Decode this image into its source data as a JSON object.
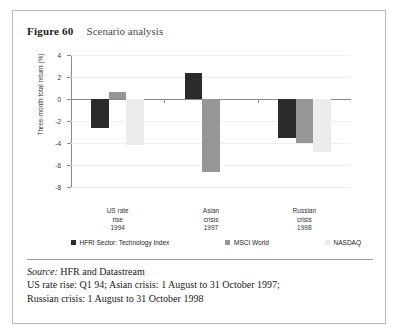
{
  "figure": {
    "number": "Figure 60",
    "title": "Scenario analysis"
  },
  "chart_data": {
    "type": "bar",
    "title": "Scenario analysis",
    "xlabel": "",
    "ylabel": "Three-month total return (%)",
    "ylim": [
      -8,
      4
    ],
    "yticks": [
      "4",
      "2",
      "0",
      "-2",
      "-4",
      "-6",
      "-8"
    ],
    "grid": true,
    "legend_position": "bottom",
    "categories": [
      "US rate\nrise\n1994",
      "Asian\ncrisis\n1997",
      "Russian\ncrisis\n1998"
    ],
    "category_lines": [
      [
        "US rate",
        "rise",
        "1994"
      ],
      [
        "Asian",
        "crisis",
        "1997"
      ],
      [
        "Russian",
        "crisis",
        "1998"
      ]
    ],
    "series": [
      {
        "name": "HFRI Sector: Technology Index",
        "color": "#2b2b2b",
        "values": [
          -2.6,
          2.4,
          -3.5
        ]
      },
      {
        "name": "MSCI World",
        "color": "#969696",
        "values": [
          0.6,
          -6.6,
          -4.0
        ]
      },
      {
        "name": "NASDAQ",
        "color": "#ececec",
        "values": [
          -4.2,
          0.0,
          -4.8
        ]
      }
    ]
  },
  "notes": {
    "source_label": "Source:",
    "source_text": "HFR and Datastream",
    "line2": "US rate rise: Q1 94; Asian crisis: 1 August to 31 October 1997;",
    "line3": "Russian crisis: 1 August to 31 October 1998"
  }
}
